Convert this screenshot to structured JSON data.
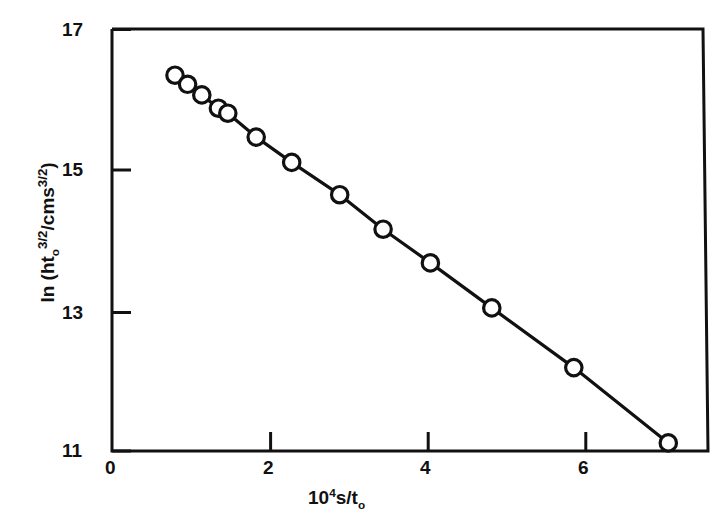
{
  "chart_data": {
    "type": "scatter",
    "title": "",
    "subtitle": "",
    "xlabel": "10^4 s/t_0",
    "xlabel_parts": {
      "mantissa": "10",
      "exponent": "4",
      "rest": "s/",
      "sub_var": "t",
      "sub": "o"
    },
    "ylabel": "ln (ht_o^3/2 / cms^3/2)",
    "ylabel_parts": {
      "ln": "ln",
      "open": "(",
      "h": "h",
      "t": "t",
      "t_sub": "o",
      "exp1": "3/2",
      "slash": "/",
      "cms": "cms",
      "exp2": "3/2",
      "close": ")"
    },
    "xlim": [
      0,
      7.72
    ],
    "ylim": [
      11,
      17
    ],
    "xticks": [
      0,
      2,
      4,
      6
    ],
    "xtick_labels": [
      "0",
      "2",
      "4",
      "6"
    ],
    "yticks": [
      11,
      13,
      15,
      17
    ],
    "ytick_labels": [
      "11",
      "13",
      "15",
      "17"
    ],
    "grid": false,
    "legend": null,
    "marker": "open-circle",
    "line_style": "solid",
    "series": [
      {
        "name": "ln(ht_o^3/2 / cms^3/2) vs 10^4 s/t_0",
        "x": [
          0.8,
          0.96,
          1.14,
          1.35,
          1.47,
          1.83,
          2.28,
          2.89,
          3.44,
          4.04,
          4.82,
          5.86,
          7.06
        ],
        "y": [
          16.35,
          16.22,
          16.07,
          15.88,
          15.81,
          15.47,
          15.11,
          14.65,
          14.16,
          13.68,
          13.04,
          12.19,
          11.12
        ]
      }
    ],
    "colors": {
      "line": "#111111",
      "marker_edge": "#111111",
      "marker_face": "#ffffff",
      "axis": "#111111",
      "background": "#ffffff"
    }
  }
}
